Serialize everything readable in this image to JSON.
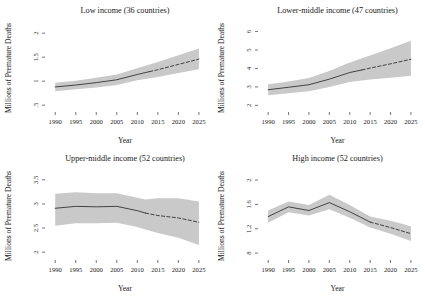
{
  "figure": {
    "panel_count": 4,
    "background": "#ffffff"
  },
  "chart_data": [
    {
      "type": "line",
      "title": "Low income (36 countries)",
      "xlabel": "Year",
      "ylabel": "Millions of Premature Deaths",
      "xlim": [
        1988,
        2026
      ],
      "ylim": [
        0.4,
        2.15
      ],
      "xticks": [
        1990,
        1995,
        2000,
        2005,
        2010,
        2015,
        2020,
        2025
      ],
      "xtick_labels": [
        "1990",
        "1995",
        "2000",
        "2005",
        "2010",
        "2015",
        "2020",
        "2025"
      ],
      "yticks": [
        0.5,
        1,
        1.5,
        2
      ],
      "ytick_labels": [
        ".5",
        "1",
        "1.5",
        "2"
      ],
      "grid": false,
      "legend": "none",
      "line_color": "#333333",
      "band_color": "#c9c9c9",
      "forecast_start": 2013,
      "x": [
        1990,
        1995,
        2000,
        2005,
        2010,
        2013,
        2015,
        2020,
        2025
      ],
      "values": [
        0.88,
        0.92,
        0.97,
        1.03,
        1.14,
        1.2,
        1.24,
        1.35,
        1.46
      ],
      "ci_lower": [
        0.79,
        0.83,
        0.87,
        0.92,
        1.02,
        1.06,
        1.09,
        1.17,
        1.25
      ],
      "ci_upper": [
        0.97,
        1.01,
        1.07,
        1.14,
        1.27,
        1.35,
        1.4,
        1.54,
        1.68
      ]
    },
    {
      "type": "line",
      "title": "Lower-middle income (47 countries)",
      "xlabel": "Year",
      "ylabel": "Millions of Premature Deaths",
      "xlim": [
        1988,
        2026
      ],
      "ylim": [
        1.75,
        6.3
      ],
      "xticks": [
        1990,
        1995,
        2000,
        2005,
        2010,
        2015,
        2020,
        2025
      ],
      "xtick_labels": [
        "1990",
        "1995",
        "2000",
        "2005",
        "2010",
        "2015",
        "2020",
        "2025"
      ],
      "yticks": [
        2,
        3,
        4,
        5,
        6
      ],
      "ytick_labels": [
        "2",
        "3",
        "4",
        "5",
        "6"
      ],
      "grid": false,
      "legend": "none",
      "line_color": "#333333",
      "band_color": "#c9c9c9",
      "forecast_start": 2013,
      "x": [
        1990,
        1995,
        2000,
        2005,
        2010,
        2013,
        2015,
        2020,
        2025
      ],
      "values": [
        2.85,
        2.98,
        3.12,
        3.42,
        3.78,
        3.92,
        4.02,
        4.25,
        4.5
      ],
      "ci_lower": [
        2.55,
        2.66,
        2.76,
        2.99,
        3.27,
        3.35,
        3.4,
        3.5,
        3.6
      ],
      "ci_upper": [
        3.14,
        3.3,
        3.48,
        3.86,
        4.32,
        4.55,
        4.7,
        5.1,
        5.5
      ]
    },
    {
      "type": "line",
      "title": "Upper-middle income (52 countries)",
      "xlabel": "Year",
      "ylabel": "Millions of Premature Deaths",
      "xlim": [
        1988,
        2026
      ],
      "ylim": [
        1.88,
        3.62
      ],
      "xticks": [
        1990,
        1995,
        2000,
        2005,
        2010,
        2015,
        2020,
        2025
      ],
      "xtick_labels": [
        "1990",
        "1995",
        "2000",
        "2005",
        "2010",
        "2015",
        "2020",
        "2025"
      ],
      "yticks": [
        2,
        2.5,
        3,
        3.5
      ],
      "ytick_labels": [
        "2",
        "2.5",
        "3",
        "3.5"
      ],
      "grid": false,
      "legend": "none",
      "line_color": "#333333",
      "band_color": "#c9c9c9",
      "forecast_start": 2012,
      "x": [
        1990,
        1995,
        2000,
        2005,
        2010,
        2012,
        2015,
        2020,
        2025
      ],
      "values": [
        2.91,
        2.95,
        2.94,
        2.95,
        2.86,
        2.81,
        2.76,
        2.71,
        2.62
      ],
      "ci_lower": [
        2.55,
        2.6,
        2.6,
        2.61,
        2.52,
        2.47,
        2.4,
        2.3,
        2.15
      ],
      "ci_upper": [
        3.21,
        3.24,
        3.22,
        3.22,
        3.13,
        3.09,
        3.12,
        3.12,
        3.05
      ]
    },
    {
      "type": "line",
      "title": "High income (52 countries)",
      "xlabel": "Year",
      "ylabel": "Millions of Premature Deaths",
      "xlim": [
        1988,
        2026
      ],
      "ylim": [
        0.72,
        2.1
      ],
      "xticks": [
        1990,
        1995,
        2000,
        2005,
        2010,
        2015,
        2020,
        2025
      ],
      "xtick_labels": [
        "1990",
        "1995",
        "2000",
        "2005",
        "2010",
        "2015",
        "2020",
        "2025"
      ],
      "yticks": [
        0.8,
        1.2,
        1.6,
        2
      ],
      "ytick_labels": [
        "8",
        "1.2",
        "1.6",
        "2"
      ],
      "grid": false,
      "legend": "none",
      "line_color": "#333333",
      "band_color": "#c9c9c9",
      "forecast_start": 2015,
      "x": [
        1990,
        1995,
        2000,
        2005,
        2010,
        2015,
        2020,
        2025
      ],
      "values": [
        1.4,
        1.56,
        1.5,
        1.63,
        1.48,
        1.31,
        1.22,
        1.12
      ],
      "ci_lower": [
        1.3,
        1.47,
        1.42,
        1.52,
        1.38,
        1.22,
        1.12,
        1.0
      ],
      "ci_upper": [
        1.5,
        1.65,
        1.59,
        1.76,
        1.59,
        1.4,
        1.33,
        1.24
      ]
    }
  ]
}
